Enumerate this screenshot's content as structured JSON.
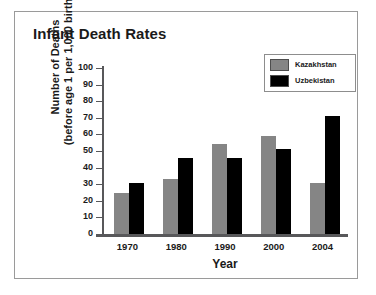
{
  "figure": {
    "title": "Infant Death Rates"
  },
  "chart_data": {
    "type": "bar",
    "title": "Infant Death Rates",
    "xlabel": "Year",
    "ylabel": "Number of Deaths (before age 1 per 1,000 births)",
    "ylabel_line1": "Number of Deaths",
    "ylabel_line2": "(before age 1 per 1,000 births)",
    "categories": [
      "1970",
      "1980",
      "1990",
      "2000",
      "2004"
    ],
    "series": [
      {
        "name": "Kazakhstan",
        "color": "#858585",
        "values": [
          25,
          33,
          54,
          59,
          31
        ]
      },
      {
        "name": "Uzbekistan",
        "color": "#000000",
        "values": [
          31,
          46,
          46,
          51,
          71
        ]
      }
    ],
    "ylim": [
      0,
      100
    ],
    "yticks": [
      100,
      90,
      80,
      70,
      60,
      50,
      40,
      30,
      20,
      10,
      0
    ],
    "grid": false,
    "legend_position": "top-right"
  },
  "legend": {
    "items": [
      {
        "label": "Kazakhstan",
        "color": "#858585"
      },
      {
        "label": "Uzbekistan",
        "color": "#000000"
      }
    ]
  },
  "colors": {
    "kazakhstan": "#858585",
    "uzbekistan": "#000000",
    "axis": "#58585a",
    "frame": "#9a9a9a",
    "text": "#1a1a1a"
  }
}
